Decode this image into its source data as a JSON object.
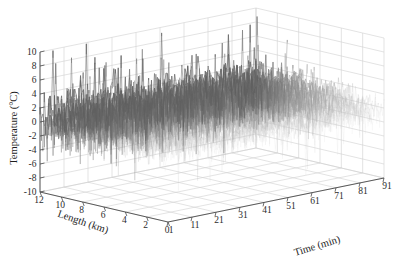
{
  "figure": {
    "background_color": "#ffffff",
    "plot_type": "3d-surface-mesh"
  },
  "chart_data": {
    "type": "line",
    "render_style": "3d-mesh-surface",
    "title": "",
    "subtitle": "",
    "xlabel": "Time (min)",
    "ylabel": "Length (km)",
    "zlabel": "Temperature (°C)",
    "legend": [],
    "legend_position": "none",
    "grid": true,
    "xlim": [
      1,
      91
    ],
    "ylim": [
      0,
      12
    ],
    "zlim": [
      -10,
      10
    ],
    "xticks": [
      1,
      11,
      21,
      31,
      41,
      51,
      61,
      71,
      81,
      91
    ],
    "yticks": [
      12,
      10,
      8,
      6,
      4,
      2,
      0
    ],
    "zticks": [
      10,
      8,
      6,
      4,
      2,
      0,
      -2,
      -4,
      -6,
      -8,
      -10
    ],
    "xtick_labels": [
      "1",
      "11",
      "21",
      "31",
      "41",
      "51",
      "61",
      "71",
      "81",
      "91"
    ],
    "ytick_labels": [
      "12",
      "10",
      "8",
      "6",
      "4",
      "2",
      "0"
    ],
    "ztick_labels": [
      "10",
      "8",
      "6",
      "4",
      "2",
      "0",
      "-2",
      "-4",
      "-6",
      "-8",
      "-10"
    ],
    "series": [
      {
        "name": "Distributed temperature trace",
        "description": "Dense noisy temperature field over length and time",
        "mean_level": 0.0,
        "noise_amplitude": 2.0,
        "peak_positive": 10.0,
        "peak_negative": -8.0,
        "density": "high",
        "color": "#8c8c8c"
      }
    ],
    "colors": {
      "surface_light": "#d9d9d9",
      "surface_mid": "#a6a6a6",
      "surface_dark": "#5a5a5a",
      "grid": "#d0d0d0",
      "axis": "#4a4a4a",
      "text": "#222222"
    }
  }
}
